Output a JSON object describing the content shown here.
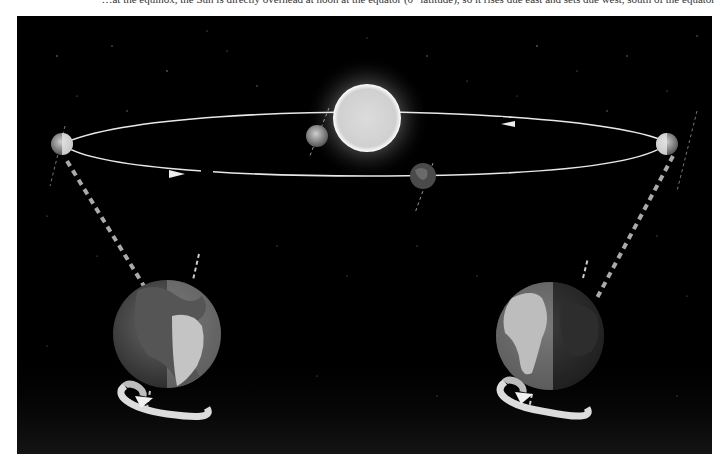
{
  "caption": {
    "text": "…at the equinox, the Sun is directly overhead at noon at the equator (0° latitude), so it rises due east and sets due west, south of the equator"
  },
  "diagram": {
    "sun": {
      "label": "Sun",
      "color": "#f4f4f4"
    },
    "orbit": {
      "color": "#e8e8e8",
      "direction": "counterclockwise (viewed from above)"
    },
    "small_earths": [
      {
        "position": "left",
        "label": "Earth at equinox (left)"
      },
      {
        "position": "back",
        "label": "Earth behind Sun"
      },
      {
        "position": "front",
        "label": "Earth in front of Sun"
      },
      {
        "position": "right",
        "label": "Earth at equinox (right)"
      }
    ],
    "large_earths": [
      {
        "position": "left",
        "label": "Enlarged Earth (left equinox)",
        "lit_side": "right"
      },
      {
        "position": "right",
        "label": "Enlarged Earth (right equinox)",
        "lit_side": "left"
      }
    ],
    "rotation_arrows": [
      {
        "position": "left",
        "label": "Earth rotation arrow"
      },
      {
        "position": "right",
        "label": "Earth rotation arrow"
      }
    ],
    "colors": {
      "background": "#000000",
      "ocean": "#4a4a4a",
      "land_lit": "#bdbdbd",
      "land_dark": "#2a2a2a"
    }
  }
}
